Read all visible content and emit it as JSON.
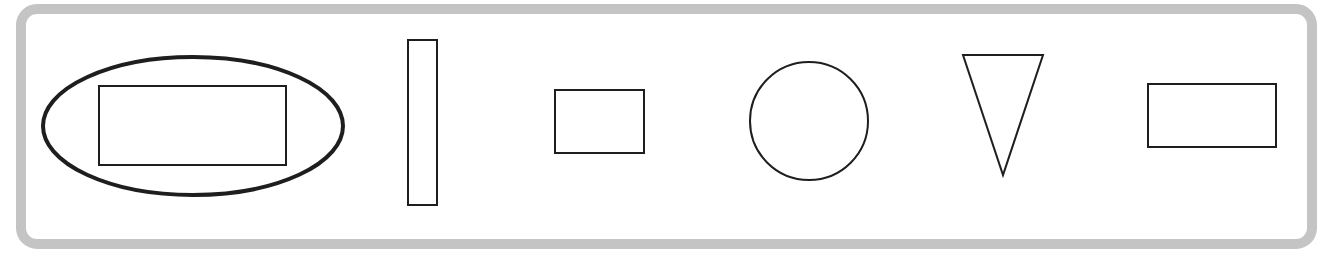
{
  "figure": {
    "width": 1319,
    "height": 268,
    "background": "#ffffff",
    "frame": {
      "x": 21,
      "y": 9,
      "width": 1291,
      "height": 235,
      "rx": 16,
      "stroke": "#c4c4c4",
      "stroke_width": 10
    },
    "shape_stroke": "#1e1e1e",
    "shapes": [
      {
        "id": "ellipse-outer",
        "type": "ellipse",
        "cx": 193,
        "cy": 126,
        "rx": 150,
        "ry": 69,
        "stroke_width": 4,
        "note": "encircles first rectangle"
      },
      {
        "id": "rect-wide-circled",
        "type": "rect",
        "x": 99,
        "y": 86,
        "width": 187,
        "height": 79,
        "stroke_width": 2
      },
      {
        "id": "rect-tall",
        "type": "rect",
        "x": 408,
        "y": 40,
        "width": 29,
        "height": 165,
        "stroke_width": 2
      },
      {
        "id": "rect-small",
        "type": "rect",
        "x": 555,
        "y": 90,
        "width": 89,
        "height": 63,
        "stroke_width": 2
      },
      {
        "id": "circle",
        "type": "circle",
        "cx": 809,
        "cy": 121,
        "r": 59,
        "stroke_width": 2
      },
      {
        "id": "triangle-down",
        "type": "polygon",
        "points": "963,55 1043,55 1003,175",
        "stroke_width": 2
      },
      {
        "id": "rect-right",
        "type": "rect",
        "x": 1148,
        "y": 84,
        "width": 128,
        "height": 63,
        "stroke_width": 2
      }
    ]
  }
}
